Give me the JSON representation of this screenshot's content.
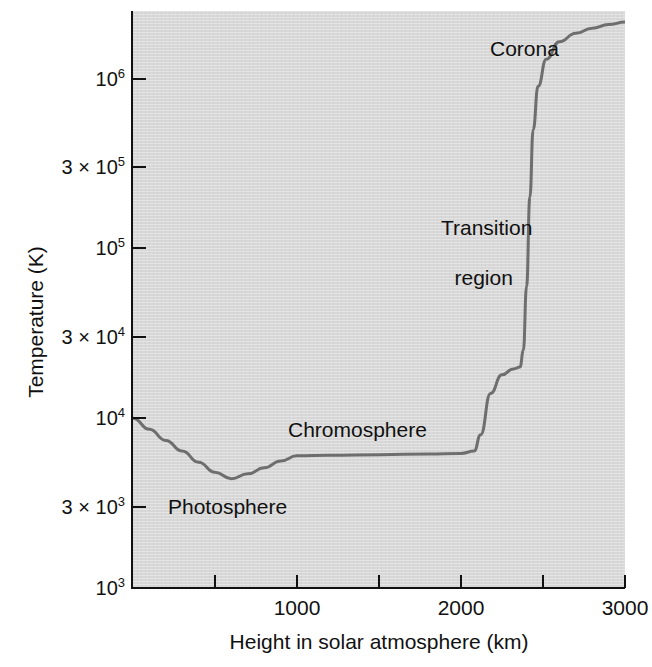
{
  "chart_data": {
    "type": "line",
    "title": "",
    "xlabel": "Height in solar atmosphere (km)",
    "ylabel": "Temperature (K)",
    "xlim": [
      0,
      3000
    ],
    "ylim": [
      1000,
      2500000
    ],
    "yscale": "log",
    "xscale": "linear",
    "grid": false,
    "legend": false,
    "series_name": "Solar atmosphere temperature profile",
    "line_color": "#6e6e6e",
    "plot_background": "#d8d8d8",
    "x": [
      0,
      100,
      200,
      300,
      400,
      500,
      600,
      700,
      800,
      900,
      1000,
      1200,
      1500,
      1800,
      2000,
      2080,
      2120,
      2180,
      2250,
      2320,
      2360,
      2380,
      2400,
      2420,
      2440,
      2470,
      2520,
      2600,
      2700,
      2800,
      2900,
      3000
    ],
    "values": [
      10000,
      8600,
      7400,
      6400,
      5500,
      4800,
      4400,
      4700,
      5100,
      5600,
      6000,
      6050,
      6100,
      6150,
      6200,
      6400,
      8000,
      14000,
      18000,
      19500,
      20000,
      25000,
      60000,
      200000,
      500000,
      900000,
      1300000,
      1650000,
      1850000,
      1980000,
      2080000,
      2150000
    ],
    "annotations": [
      {
        "text": "Photosphere",
        "x": 620,
        "y": 3300
      },
      {
        "text": "Chromosphere",
        "x": 1600,
        "y": 9600
      },
      {
        "text": "Transition region",
        "x": 2180,
        "y": 260000
      },
      {
        "text": "Corona",
        "x": 2600,
        "y": 1900000
      }
    ],
    "yticks": [
      {
        "value": 1000,
        "mantissa": "10",
        "exponent": "3",
        "times": false
      },
      {
        "value": 3000,
        "mantissa": "3 × 10",
        "exponent": "3",
        "times": true
      },
      {
        "value": 10000,
        "mantissa": "10",
        "exponent": "4",
        "times": false
      },
      {
        "value": 30000,
        "mantissa": "3 × 10",
        "exponent": "4",
        "times": true
      },
      {
        "value": 100000,
        "mantissa": "10",
        "exponent": "5",
        "times": false
      },
      {
        "value": 300000,
        "mantissa": "3 × 10",
        "exponent": "5",
        "times": true
      },
      {
        "value": 1000000,
        "mantissa": "10",
        "exponent": "6",
        "times": false
      }
    ],
    "xticks": [
      {
        "value": 0,
        "label": ""
      },
      {
        "value": 500,
        "label": ""
      },
      {
        "value": 1000,
        "label": "1000"
      },
      {
        "value": 1500,
        "label": ""
      },
      {
        "value": 2000,
        "label": "2000"
      },
      {
        "value": 2500,
        "label": ""
      },
      {
        "value": 3000,
        "label": "3000"
      }
    ]
  },
  "axis": {
    "ylabel_text": "Temperature (K)",
    "xlabel_text": "Height in solar atmosphere (km)"
  },
  "annotations": {
    "photosphere": "Photosphere",
    "chromosphere": "Chromosphere",
    "transition_line1": "Transition",
    "transition_line2": "region",
    "corona": "Corona"
  }
}
